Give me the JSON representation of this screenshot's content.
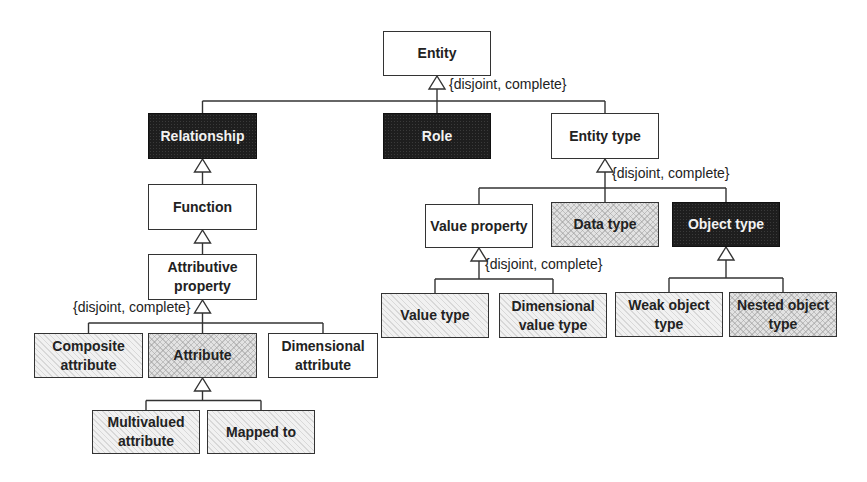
{
  "diagram": {
    "type": "uml-generalization-hierarchy",
    "nodes": [
      {
        "id": "entity",
        "label": "Entity",
        "style": "white",
        "x": 383,
        "y": 31,
        "w": 108,
        "h": 45
      },
      {
        "id": "relationship",
        "label": "Relationship",
        "style": "dark",
        "x": 148,
        "y": 113,
        "w": 109,
        "h": 46
      },
      {
        "id": "role",
        "label": "Role",
        "style": "dark",
        "x": 383,
        "y": 113,
        "w": 108,
        "h": 46
      },
      {
        "id": "entity-type",
        "label": "Entity type",
        "style": "white",
        "x": 551,
        "y": 113,
        "w": 108,
        "h": 46
      },
      {
        "id": "function",
        "label": "Function",
        "style": "white",
        "x": 148,
        "y": 184,
        "w": 109,
        "h": 46
      },
      {
        "id": "attributive-property",
        "label": "Attributive property",
        "style": "white",
        "x": 148,
        "y": 254,
        "w": 109,
        "h": 46
      },
      {
        "id": "composite-attribute",
        "label": "Composite attribute",
        "style": "light",
        "x": 34,
        "y": 333,
        "w": 109,
        "h": 45
      },
      {
        "id": "attribute",
        "label": "Attribute",
        "style": "hatch",
        "x": 148,
        "y": 333,
        "w": 109,
        "h": 45
      },
      {
        "id": "dimensional-attribute",
        "label": "Dimensional attribute",
        "style": "white",
        "x": 268,
        "y": 333,
        "w": 110,
        "h": 45
      },
      {
        "id": "multivalued-attribute",
        "label": "Multivalued attribute",
        "style": "light",
        "x": 92,
        "y": 410,
        "w": 108,
        "h": 44
      },
      {
        "id": "mapped-to",
        "label": "Mapped to",
        "style": "light",
        "x": 207,
        "y": 410,
        "w": 108,
        "h": 44
      },
      {
        "id": "value-property",
        "label": "Value property",
        "style": "white",
        "x": 425,
        "y": 204,
        "w": 108,
        "h": 44
      },
      {
        "id": "data-type",
        "label": "Data type",
        "style": "hatch",
        "x": 551,
        "y": 202,
        "w": 108,
        "h": 45
      },
      {
        "id": "object-type",
        "label": "Object type",
        "style": "dark",
        "x": 672,
        "y": 202,
        "w": 108,
        "h": 45
      },
      {
        "id": "value-type",
        "label": "Value type",
        "style": "light",
        "x": 381,
        "y": 293,
        "w": 108,
        "h": 45
      },
      {
        "id": "dimensional-value-type",
        "label": "Dimensional value type",
        "style": "light",
        "x": 499,
        "y": 293,
        "w": 108,
        "h": 45
      },
      {
        "id": "weak-object-type",
        "label": "Weak object type",
        "style": "light",
        "x": 615,
        "y": 292,
        "w": 108,
        "h": 45
      },
      {
        "id": "nested-object-type",
        "label": "Nested object type",
        "style": "hatch",
        "x": 729,
        "y": 292,
        "w": 108,
        "h": 45
      }
    ],
    "generalizations": [
      {
        "parent": "entity",
        "children": [
          "relationship",
          "role",
          "entity-type"
        ],
        "constraint": "{disjoint, complete}"
      },
      {
        "parent": "relationship",
        "children": [
          "function"
        ],
        "constraint": ""
      },
      {
        "parent": "function",
        "children": [
          "attributive-property"
        ],
        "constraint": ""
      },
      {
        "parent": "attributive-property",
        "children": [
          "composite-attribute",
          "attribute",
          "dimensional-attribute"
        ],
        "constraint": "{disjoint, complete}"
      },
      {
        "parent": "attribute",
        "children": [
          "multivalued-attribute",
          "mapped-to"
        ],
        "constraint": ""
      },
      {
        "parent": "entity-type",
        "children": [
          "value-property",
          "data-type",
          "object-type"
        ],
        "constraint": "{disjoint, complete}"
      },
      {
        "parent": "value-property",
        "children": [
          "value-type",
          "dimensional-value-type"
        ],
        "constraint": "{disjoint, complete}"
      },
      {
        "parent": "object-type",
        "children": [
          "weak-object-type",
          "nested-object-type"
        ],
        "constraint": ""
      }
    ],
    "constraint_labels": [
      {
        "id": "entity-constraint",
        "text": "{disjoint, complete}",
        "x": 449,
        "y": 79
      },
      {
        "id": "entity-type-constraint",
        "text": "{disjoint, complete}",
        "x": 612,
        "y": 168
      },
      {
        "id": "attributive-property-constraint",
        "text": "{disjoint, complete}",
        "x": 73,
        "y": 302
      },
      {
        "id": "value-property-constraint",
        "text": "{disjoint, complete}",
        "x": 485,
        "y": 259
      }
    ]
  }
}
